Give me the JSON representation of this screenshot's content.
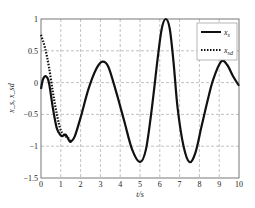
{
  "chart_data": {
    "type": "line",
    "title": "",
    "xlabel": "t/s",
    "ylabel": "x_s, x_sd",
    "xlim": [
      0,
      10
    ],
    "ylim": [
      -1.5,
      1
    ],
    "xticks": [
      "0",
      "1",
      "2",
      "3",
      "4",
      "5",
      "6",
      "7",
      "8",
      "9",
      "10"
    ],
    "yticks": [
      "1",
      "0.5",
      "0",
      "-0.5",
      "-1",
      "-1.5"
    ],
    "grid": true,
    "legend_position": "upper right",
    "series": [
      {
        "name": "x_s",
        "style": "solid",
        "x": [
          0,
          0.1,
          0.25,
          0.4,
          0.6,
          0.8,
          1.0,
          1.1,
          1.25,
          1.4,
          1.5,
          1.7,
          2.0,
          2.4,
          2.8,
          3.1,
          3.4,
          3.8,
          4.2,
          4.6,
          5.0,
          5.3,
          5.6,
          5.9,
          6.1,
          6.3,
          6.5,
          6.7,
          6.9,
          7.2,
          7.5,
          7.8,
          8.1,
          8.4,
          8.7,
          9.1,
          9.4,
          9.7,
          10.0
        ],
        "y": [
          -0.1,
          0.05,
          0.1,
          0.0,
          -0.4,
          -0.72,
          -0.83,
          -0.84,
          -0.82,
          -0.9,
          -0.93,
          -0.85,
          -0.55,
          -0.1,
          0.22,
          0.33,
          0.25,
          -0.15,
          -0.6,
          -1.05,
          -1.25,
          -1.05,
          -0.4,
          0.4,
          0.85,
          1.0,
          0.85,
          0.3,
          -0.4,
          -1.0,
          -1.25,
          -1.1,
          -0.7,
          -0.3,
          0.05,
          0.33,
          0.28,
          0.1,
          -0.05
        ]
      },
      {
        "name": "x_sd",
        "style": "dotted",
        "x": [
          0,
          0.2,
          0.4,
          0.6,
          0.8,
          1.0,
          1.2,
          1.4,
          1.5
        ],
        "y": [
          0.75,
          0.55,
          0.25,
          -0.15,
          -0.5,
          -0.75,
          -0.83,
          -0.88,
          -0.93
        ]
      }
    ]
  },
  "legend": {
    "items": [
      {
        "label": "x_s",
        "main": "x",
        "sub": "s"
      },
      {
        "label": "x_sd",
        "main": "x",
        "sub": "sd"
      }
    ]
  },
  "axes": {
    "xlabel_main": "t/s",
    "ylabel_main": "x_s, x_sd"
  }
}
